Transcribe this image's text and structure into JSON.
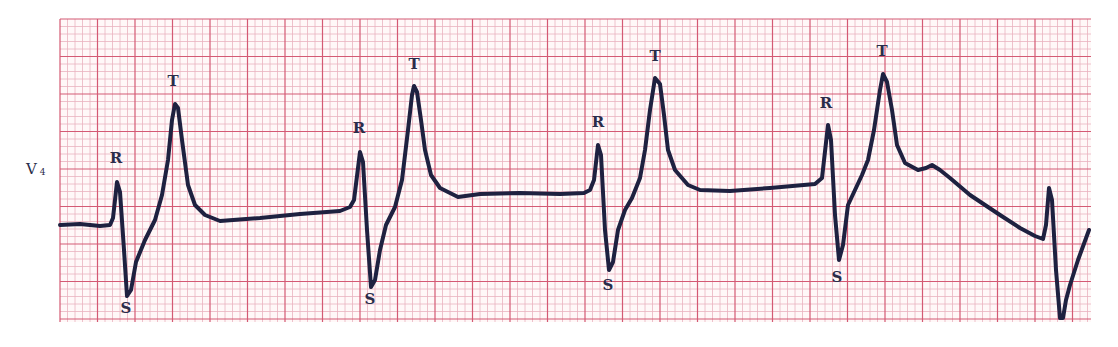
{
  "chart_data": {
    "type": "line",
    "title": "",
    "lead": "V",
    "lead_sub": "4",
    "xlabel": "",
    "ylabel": "",
    "grid": true,
    "grid_colors": {
      "minor": "#eab3bf",
      "major": "#d45a74",
      "background": "#fff8f8"
    },
    "trace_color": "#1e2140",
    "grid_box": {
      "x": 60,
      "y": 19,
      "width": 1031,
      "height": 303,
      "minor_px": 7.5,
      "major_every": 5
    },
    "trace_points": [
      [
        60,
        225
      ],
      [
        80,
        224
      ],
      [
        100,
        226
      ],
      [
        110,
        225
      ],
      [
        113,
        218
      ],
      [
        117,
        182
      ],
      [
        120,
        192
      ],
      [
        124,
        250
      ],
      [
        127,
        296
      ],
      [
        131,
        290
      ],
      [
        136,
        262
      ],
      [
        145,
        240
      ],
      [
        155,
        220
      ],
      [
        162,
        195
      ],
      [
        168,
        160
      ],
      [
        172,
        120
      ],
      [
        175,
        104
      ],
      [
        178,
        108
      ],
      [
        182,
        140
      ],
      [
        188,
        185
      ],
      [
        195,
        205
      ],
      [
        205,
        215
      ],
      [
        220,
        221
      ],
      [
        260,
        218
      ],
      [
        300,
        214
      ],
      [
        340,
        211
      ],
      [
        350,
        207
      ],
      [
        354,
        200
      ],
      [
        360,
        152
      ],
      [
        363,
        162
      ],
      [
        367,
        230
      ],
      [
        371,
        287
      ],
      [
        375,
        280
      ],
      [
        380,
        250
      ],
      [
        386,
        225
      ],
      [
        395,
        207
      ],
      [
        402,
        180
      ],
      [
        408,
        130
      ],
      [
        412,
        95
      ],
      [
        414,
        86
      ],
      [
        417,
        92
      ],
      [
        421,
        120
      ],
      [
        425,
        150
      ],
      [
        431,
        175
      ],
      [
        440,
        188
      ],
      [
        458,
        197
      ],
      [
        480,
        194
      ],
      [
        520,
        193
      ],
      [
        560,
        194
      ],
      [
        584,
        193
      ],
      [
        590,
        190
      ],
      [
        594,
        180
      ],
      [
        598,
        145
      ],
      [
        601,
        155
      ],
      [
        605,
        230
      ],
      [
        609,
        270
      ],
      [
        613,
        262
      ],
      [
        618,
        230
      ],
      [
        625,
        210
      ],
      [
        632,
        198
      ],
      [
        640,
        178
      ],
      [
        645,
        150
      ],
      [
        650,
        110
      ],
      [
        655,
        78
      ],
      [
        660,
        84
      ],
      [
        664,
        115
      ],
      [
        668,
        150
      ],
      [
        675,
        170
      ],
      [
        688,
        185
      ],
      [
        700,
        190
      ],
      [
        730,
        191
      ],
      [
        770,
        188
      ],
      [
        815,
        184
      ],
      [
        822,
        178
      ],
      [
        828,
        125
      ],
      [
        831,
        140
      ],
      [
        835,
        215
      ],
      [
        839,
        260
      ],
      [
        843,
        245
      ],
      [
        848,
        205
      ],
      [
        855,
        190
      ],
      [
        862,
        175
      ],
      [
        868,
        160
      ],
      [
        874,
        130
      ],
      [
        880,
        90
      ],
      [
        883,
        74
      ],
      [
        887,
        82
      ],
      [
        892,
        110
      ],
      [
        897,
        145
      ],
      [
        905,
        163
      ],
      [
        918,
        170
      ],
      [
        926,
        168
      ],
      [
        932,
        165
      ],
      [
        940,
        170
      ],
      [
        950,
        178
      ],
      [
        970,
        195
      ],
      [
        1000,
        215
      ],
      [
        1020,
        228
      ],
      [
        1035,
        236
      ],
      [
        1043,
        239
      ],
      [
        1046,
        225
      ],
      [
        1049,
        188
      ],
      [
        1052,
        200
      ],
      [
        1056,
        270
      ],
      [
        1060,
        318
      ],
      [
        1063,
        318
      ],
      [
        1066,
        300
      ],
      [
        1070,
        285
      ],
      [
        1078,
        260
      ],
      [
        1089,
        230
      ]
    ],
    "annotations": [
      {
        "text": "R",
        "x": 116,
        "y": 163
      },
      {
        "text": "S",
        "x": 126,
        "y": 313
      },
      {
        "text": "T",
        "x": 173,
        "y": 86
      },
      {
        "text": "R",
        "x": 359,
        "y": 133
      },
      {
        "text": "S",
        "x": 370,
        "y": 304
      },
      {
        "text": "T",
        "x": 414,
        "y": 69
      },
      {
        "text": "R",
        "x": 598,
        "y": 127
      },
      {
        "text": "S",
        "x": 608,
        "y": 290
      },
      {
        "text": "T",
        "x": 655,
        "y": 61
      },
      {
        "text": "R",
        "x": 826,
        "y": 108
      },
      {
        "text": "S",
        "x": 837,
        "y": 282
      },
      {
        "text": "T",
        "x": 882,
        "y": 56
      }
    ],
    "beats": [
      {
        "R": [
          117,
          182
        ],
        "S": [
          127,
          296
        ],
        "T": [
          175,
          104
        ]
      },
      {
        "R": [
          360,
          152
        ],
        "S": [
          371,
          287
        ],
        "T": [
          414,
          86
        ]
      },
      {
        "R": [
          598,
          145
        ],
        "S": [
          609,
          270
        ],
        "T": [
          655,
          78
        ]
      },
      {
        "R": [
          828,
          125
        ],
        "S": [
          839,
          260
        ],
        "T": [
          883,
          74
        ]
      },
      {
        "R": [
          1049,
          188
        ],
        "S": [
          1061,
          318
        ],
        "T": null
      }
    ]
  }
}
